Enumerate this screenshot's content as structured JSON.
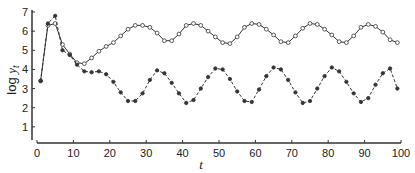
{
  "chart_data": {
    "type": "line",
    "title": "",
    "xlabel": "t",
    "ylabel": "log y_t",
    "ylabel_prefix": "log ",
    "ylabel_var": "y",
    "ylabel_sub": "t",
    "xlim": [
      0,
      100
    ],
    "ylim": [
      0,
      7
    ],
    "xticks": [
      0,
      10,
      20,
      30,
      40,
      50,
      60,
      70,
      80,
      90,
      100
    ],
    "yticks": [
      1,
      2,
      3,
      4,
      5,
      6,
      7
    ],
    "grid": false,
    "legend": null,
    "x": [
      1,
      3,
      5,
      7,
      9,
      11,
      13,
      15,
      17,
      19,
      21,
      23,
      25,
      27,
      29,
      31,
      33,
      35,
      37,
      39,
      41,
      43,
      45,
      47,
      49,
      51,
      53,
      55,
      57,
      59,
      61,
      63,
      65,
      67,
      69,
      71,
      73,
      75,
      77,
      79,
      81,
      83,
      85,
      87,
      89,
      91,
      93,
      95,
      97,
      99
    ],
    "series": [
      {
        "name": "open-circle solid",
        "marker": "open-circle",
        "line": "solid",
        "values": [
          3.4,
          6.3,
          6.4,
          5.3,
          4.8,
          4.35,
          4.3,
          4.6,
          4.95,
          5.2,
          5.4,
          5.75,
          6.1,
          6.3,
          6.3,
          6.2,
          5.9,
          5.5,
          5.5,
          5.85,
          6.3,
          6.4,
          6.3,
          6.0,
          5.7,
          5.4,
          5.35,
          5.7,
          6.2,
          6.4,
          6.35,
          6.1,
          5.8,
          5.45,
          5.4,
          5.75,
          6.15,
          6.4,
          6.35,
          6.1,
          5.8,
          5.45,
          5.4,
          5.75,
          6.2,
          6.35,
          6.25,
          5.95,
          5.55,
          5.4
        ]
      },
      {
        "name": "filled-circle dashed",
        "marker": "filled-circle",
        "line": "dashed",
        "values": [
          3.4,
          6.4,
          6.8,
          5.0,
          4.75,
          4.25,
          3.9,
          3.85,
          3.9,
          3.75,
          3.35,
          2.8,
          2.35,
          2.35,
          2.75,
          3.45,
          3.95,
          3.8,
          3.3,
          2.75,
          2.25,
          2.4,
          3.0,
          3.6,
          4.05,
          4.0,
          3.5,
          2.85,
          2.35,
          2.3,
          2.95,
          3.65,
          4.1,
          4.0,
          3.45,
          2.8,
          2.25,
          2.35,
          3.0,
          3.65,
          4.1,
          3.9,
          3.35,
          2.75,
          2.3,
          2.5,
          3.2,
          3.8,
          4.05,
          3.0
        ]
      }
    ]
  },
  "layout": {
    "x0_px": 37,
    "x100_px": 401,
    "y0_px": 146,
    "y7_px": 12,
    "line_color": "#333333"
  }
}
